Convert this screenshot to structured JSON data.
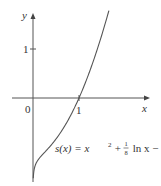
{
  "chart_data": {
    "type": "line",
    "title": "",
    "function_label": {
      "lhs": "s(x) = x",
      "exp": "2",
      "plus": " + ",
      "frac_num": "1",
      "frac_den": "8",
      "rest": " ln x − 1"
    },
    "xlabel": "x",
    "ylabel": "y",
    "origin_label": "0",
    "x_ticks": [
      {
        "value": 1,
        "label": "1"
      }
    ],
    "y_ticks": [
      {
        "value": 1,
        "label": "1"
      }
    ],
    "xlim": [
      -1.2,
      2.2
    ],
    "ylim": [
      -1.8,
      2.0
    ],
    "grid": false,
    "legend": null,
    "series": [
      {
        "name": "s(x) = x^2 + (1/8) ln x - 1",
        "color": "#555555",
        "x": [
          0.006,
          0.02,
          0.05,
          0.1,
          0.2,
          0.3,
          0.4,
          0.5,
          0.6,
          0.7,
          0.8,
          0.9,
          1.0,
          1.1,
          1.2,
          1.3,
          1.4,
          1.5,
          1.6,
          1.65
        ],
        "values": [
          -1.64,
          -1.49,
          -1.37,
          -1.28,
          -1.24,
          -1.06,
          -0.95,
          -0.84,
          -0.7,
          -0.55,
          -0.39,
          -0.2,
          0.0,
          0.22,
          0.46,
          0.72,
          1.0,
          1.3,
          1.62,
          1.79
        ]
      }
    ],
    "zero_crossing": {
      "x": 1,
      "y": 0
    }
  },
  "colors": {
    "axis": "#555555",
    "curve": "#666666",
    "text": "#333333"
  }
}
